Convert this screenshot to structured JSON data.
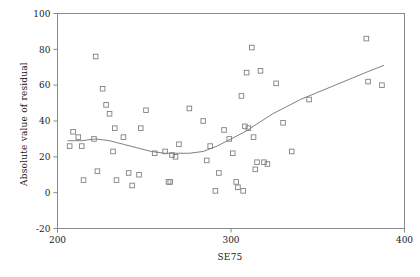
{
  "chart_data": {
    "type": "scatter",
    "title": "",
    "xlabel": "SE75",
    "ylabel": "Absolute value of residual",
    "xlim": [
      200,
      400
    ],
    "ylim": [
      -20,
      100
    ],
    "xticks": [
      200,
      300,
      400
    ],
    "yticks": [
      -20,
      0,
      20,
      40,
      60,
      80,
      100
    ],
    "grid": false,
    "legend": "none",
    "marker": "open-square",
    "marker_color": "#808080",
    "line_color": "#808080",
    "frame": true,
    "points": [
      {
        "x": 207,
        "y": 26
      },
      {
        "x": 209,
        "y": 34
      },
      {
        "x": 212,
        "y": 31
      },
      {
        "x": 214,
        "y": 26
      },
      {
        "x": 215,
        "y": 7
      },
      {
        "x": 221,
        "y": 30
      },
      {
        "x": 222,
        "y": 76
      },
      {
        "x": 223,
        "y": 12
      },
      {
        "x": 226,
        "y": 58
      },
      {
        "x": 228,
        "y": 49
      },
      {
        "x": 230,
        "y": 44
      },
      {
        "x": 232,
        "y": 23
      },
      {
        "x": 233,
        "y": 36
      },
      {
        "x": 234,
        "y": 7
      },
      {
        "x": 238,
        "y": 31
      },
      {
        "x": 241,
        "y": 11
      },
      {
        "x": 243,
        "y": 4
      },
      {
        "x": 247,
        "y": 10
      },
      {
        "x": 248,
        "y": 36
      },
      {
        "x": 251,
        "y": 46
      },
      {
        "x": 256,
        "y": 22
      },
      {
        "x": 262,
        "y": 23
      },
      {
        "x": 264,
        "y": 6
      },
      {
        "x": 265,
        "y": 6
      },
      {
        "x": 266,
        "y": 21
      },
      {
        "x": 268,
        "y": 20
      },
      {
        "x": 270,
        "y": 27
      },
      {
        "x": 276,
        "y": 47
      },
      {
        "x": 284,
        "y": 40
      },
      {
        "x": 286,
        "y": 18
      },
      {
        "x": 288,
        "y": 26
      },
      {
        "x": 291,
        "y": 1
      },
      {
        "x": 293,
        "y": 11
      },
      {
        "x": 296,
        "y": 35
      },
      {
        "x": 299,
        "y": 30
      },
      {
        "x": 301,
        "y": 22
      },
      {
        "x": 303,
        "y": 6
      },
      {
        "x": 304,
        "y": 3
      },
      {
        "x": 306,
        "y": 54
      },
      {
        "x": 307,
        "y": 1
      },
      {
        "x": 308,
        "y": 37
      },
      {
        "x": 309,
        "y": 67
      },
      {
        "x": 310,
        "y": 36
      },
      {
        "x": 312,
        "y": 81
      },
      {
        "x": 313,
        "y": 31
      },
      {
        "x": 314,
        "y": 13
      },
      {
        "x": 315,
        "y": 17
      },
      {
        "x": 317,
        "y": 68
      },
      {
        "x": 319,
        "y": 17
      },
      {
        "x": 321,
        "y": 16
      },
      {
        "x": 326,
        "y": 61
      },
      {
        "x": 330,
        "y": 39
      },
      {
        "x": 335,
        "y": 23
      },
      {
        "x": 345,
        "y": 52
      },
      {
        "x": 378,
        "y": 86
      },
      {
        "x": 379,
        "y": 62
      },
      {
        "x": 387,
        "y": 60
      }
    ],
    "smoother": {
      "name": "lowess",
      "points": [
        {
          "x": 206,
          "y": 29
        },
        {
          "x": 214,
          "y": 29
        },
        {
          "x": 222,
          "y": 30
        },
        {
          "x": 230,
          "y": 29
        },
        {
          "x": 238,
          "y": 27
        },
        {
          "x": 246,
          "y": 25
        },
        {
          "x": 254,
          "y": 23
        },
        {
          "x": 262,
          "y": 22
        },
        {
          "x": 268,
          "y": 22
        },
        {
          "x": 276,
          "y": 22
        },
        {
          "x": 284,
          "y": 23
        },
        {
          "x": 292,
          "y": 26
        },
        {
          "x": 300,
          "y": 30
        },
        {
          "x": 308,
          "y": 34
        },
        {
          "x": 316,
          "y": 39
        },
        {
          "x": 324,
          "y": 44
        },
        {
          "x": 332,
          "y": 48
        },
        {
          "x": 340,
          "y": 52
        },
        {
          "x": 350,
          "y": 56
        },
        {
          "x": 360,
          "y": 60
        },
        {
          "x": 370,
          "y": 64
        },
        {
          "x": 380,
          "y": 68
        },
        {
          "x": 388,
          "y": 71
        }
      ]
    }
  }
}
